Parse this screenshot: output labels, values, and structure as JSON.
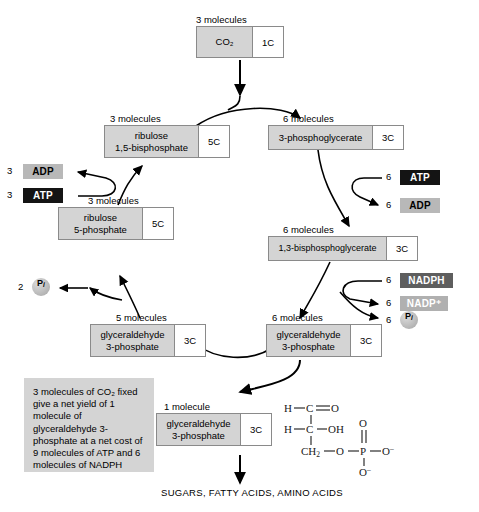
{
  "diagram": {
    "colors": {
      "box_fill": "#d4d4d4",
      "box_border": "#8a8a8a",
      "carbon_cell": "#ffffff",
      "atp_chip": "#141414",
      "adp_chip": "#b8b8b8",
      "nadph_chip": "#5e5e5e",
      "nadp_chip": "#b0b0b0",
      "note_fill": "#d4d4d4",
      "arrow": "#000000"
    }
  },
  "nodes": {
    "co2": {
      "caption": "3 molecules",
      "name": "CO2",
      "name_display": "CO₂",
      "carbons": "1C"
    },
    "rubp": {
      "caption": "3 molecules",
      "name_display": "ribulose\n1,5-bisphosphate",
      "carbons": "5C"
    },
    "pga": {
      "caption": "6 molecules",
      "name_display": "3-phosphoglycerate",
      "carbons": "3C"
    },
    "ru5p": {
      "caption": "3 molecules",
      "name_display": "ribulose\n5-phosphate",
      "carbons": "5C"
    },
    "bpg": {
      "caption": "6 molecules",
      "name_display": "1,3-bisphosphoglycerate",
      "carbons": "3C"
    },
    "g3p_left": {
      "caption": "5 molecules",
      "name_display": "glyceraldehyde\n3-phosphate",
      "carbons": "3C"
    },
    "g3p_right": {
      "caption": "6 molecules",
      "name_display": "glyceraldehyde\n3-phosphate",
      "carbons": "3C"
    },
    "g3p_product": {
      "caption": "1 molecule",
      "name_display": "glyceraldehyde\n3-phosphate",
      "carbons": "3C"
    }
  },
  "cofactors": {
    "adp_left": {
      "coefficient": "3",
      "label": "ADP"
    },
    "atp_left": {
      "coefficient": "3",
      "label": "ATP"
    },
    "pi_left": {
      "coefficient": "2",
      "label": "P",
      "subscript": "i"
    },
    "atp_right": {
      "coefficient": "6",
      "label": "ATP"
    },
    "adp_right": {
      "coefficient": "6",
      "label": "ADP"
    },
    "nadph_right": {
      "coefficient": "6",
      "label": "NADPH"
    },
    "nadp_right": {
      "coefficient": "6",
      "label": "NADP+",
      "label_display": "NADP⁺"
    },
    "pi_right": {
      "coefficient": "6",
      "label": "P",
      "subscript": "i"
    }
  },
  "note": {
    "text": "3 molecules of CO₂ fixed give a net yield of 1 molecule of glyceraldehyde 3-phosphate at a net cost of 9 molecules of ATP and 6 molecules of NADPH"
  },
  "product": {
    "label": "SUGARS, FATTY ACIDS, AMINO ACIDS"
  },
  "structure": {
    "name": "glyceraldehyde 3-phosphate",
    "atoms": {
      "h1": "H",
      "c1": "C",
      "o1": "O",
      "h2": "H",
      "c2": "C",
      "oh": "OH",
      "ch2": "CH₂",
      "o_ester": "O",
      "p": "P",
      "o_double": "O",
      "o_minus_right": "O⁻",
      "o_minus_bottom": "O⁻"
    }
  }
}
